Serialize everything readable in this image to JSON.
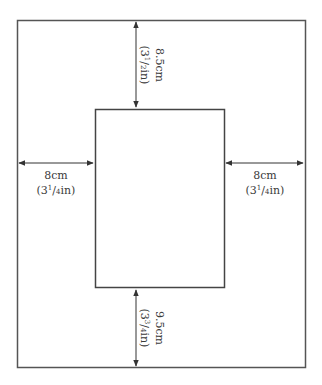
{
  "diagram": {
    "type": "page-margin-layout",
    "outer_frame": {
      "x": 17,
      "y": 20,
      "width": 288,
      "height": 348,
      "stroke": "#555555"
    },
    "inner_rect": {
      "x": 95,
      "y": 109,
      "width": 129,
      "height": 179,
      "stroke": "#444444"
    },
    "arrow_color": "#333333",
    "label_color": "#3a3a3a"
  },
  "labels": {
    "top": {
      "metric": "8.5cm",
      "imperial_pre": "(3",
      "imperial_num": "1",
      "imperial_den": "2",
      "imperial_post": "in)"
    },
    "bottom": {
      "metric": "9.5cm",
      "imperial_pre": "(3",
      "imperial_num": "3",
      "imperial_den": "4",
      "imperial_post": "in)"
    },
    "left": {
      "metric": "8cm",
      "imperial_pre": "(3",
      "imperial_num": "1",
      "imperial_den": "4",
      "imperial_post": "in)"
    },
    "right": {
      "metric": "8cm",
      "imperial_pre": "(3",
      "imperial_num": "1",
      "imperial_den": "4",
      "imperial_post": "in)"
    }
  }
}
